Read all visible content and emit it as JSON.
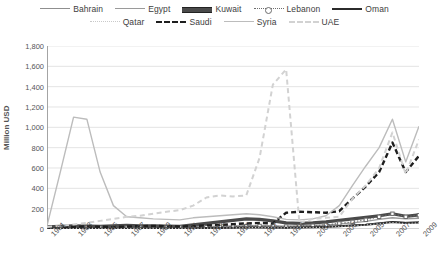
{
  "chart_data": {
    "type": "line",
    "title": "",
    "xlabel": "",
    "ylabel": "Million USD",
    "ylim": [
      0,
      1800
    ],
    "ytick_step": 200,
    "grid": true,
    "legend_position": "top",
    "yticks": [
      "1,800",
      "1,600",
      "1,400",
      "1,200",
      "1,000",
      "800",
      "600",
      "400",
      "200",
      "0"
    ],
    "x": [
      1981,
      1982,
      1983,
      1984,
      1985,
      1986,
      1987,
      1988,
      1989,
      1990,
      1991,
      1992,
      1993,
      1994,
      1995,
      1996,
      1997,
      1998,
      1999,
      2000,
      2001,
      2002,
      2003,
      2004,
      2005,
      2006,
      2007,
      2008,
      2009
    ],
    "xtick_labels": [
      "1981",
      "1983",
      "1985",
      "1987",
      "1989",
      "1991",
      "1993",
      "1995",
      "1997",
      "1999",
      "2001",
      "2003",
      "2005",
      "2007",
      "2009"
    ],
    "series": [
      {
        "name": "Bahrain",
        "style": "solid-medium",
        "color": "#8f8f8f",
        "values": [
          5,
          6,
          8,
          10,
          9,
          11,
          10,
          12,
          14,
          13,
          12,
          15,
          16,
          18,
          20,
          22,
          21,
          19,
          18,
          20,
          22,
          25,
          30,
          38,
          45,
          60,
          72,
          65,
          70
        ]
      },
      {
        "name": "Egypt",
        "style": "solid-medium",
        "color": "#9a9a9a",
        "values": [
          12,
          14,
          16,
          18,
          15,
          17,
          19,
          20,
          22,
          18,
          16,
          20,
          24,
          26,
          30,
          32,
          34,
          30,
          28,
          30,
          34,
          40,
          48,
          60,
          75,
          95,
          110,
          100,
          105
        ]
      },
      {
        "name": "Kuwait",
        "style": "thick-dark",
        "color": "#4a4a4a",
        "values": [
          20,
          25,
          30,
          28,
          26,
          30,
          35,
          32,
          30,
          28,
          25,
          40,
          55,
          70,
          85,
          100,
          95,
          80,
          60,
          55,
          60,
          70,
          85,
          100,
          115,
          130,
          150,
          125,
          140
        ]
      },
      {
        "name": "Lebanon",
        "style": "dotted-marker",
        "color": "#6d6d6d",
        "values": [
          8,
          10,
          12,
          14,
          12,
          10,
          12,
          14,
          16,
          15,
          14,
          16,
          18,
          20,
          24,
          28,
          30,
          26,
          24,
          28,
          32,
          40,
          55,
          70,
          90,
          120,
          150,
          120,
          135
        ]
      },
      {
        "name": "Oman",
        "style": "solid-black",
        "color": "#2b2b2b",
        "values": [
          4,
          5,
          6,
          7,
          6,
          5,
          6,
          7,
          8,
          7,
          6,
          8,
          9,
          10,
          12,
          14,
          15,
          13,
          12,
          14,
          16,
          20,
          26,
          34,
          42,
          55,
          68,
          58,
          64
        ]
      },
      {
        "name": "Qatar",
        "style": "dotted-light",
        "color": "#c9c9c9",
        "values": [
          3,
          4,
          5,
          6,
          5,
          4,
          5,
          6,
          7,
          6,
          5,
          7,
          8,
          9,
          11,
          13,
          14,
          12,
          11,
          13,
          15,
          18,
          24,
          32,
          40,
          52,
          64,
          54,
          60
        ]
      },
      {
        "name": "Saudi",
        "style": "dashed-black",
        "color": "#1e1e1e",
        "values": [
          15,
          18,
          22,
          25,
          22,
          20,
          24,
          28,
          30,
          28,
          25,
          30,
          35,
          40,
          48,
          55,
          60,
          55,
          160,
          170,
          165,
          160,
          175,
          300,
          420,
          560,
          850,
          560,
          720
        ]
      },
      {
        "name": "Syria",
        "style": "solid-light",
        "color": "#bcbcbc",
        "values": [
          30,
          560,
          1100,
          1080,
          560,
          230,
          120,
          110,
          100,
          95,
          90,
          110,
          120,
          130,
          140,
          150,
          140,
          120,
          95,
          90,
          100,
          130,
          230,
          430,
          620,
          800,
          1080,
          660,
          1010
        ]
      },
      {
        "name": "UAE",
        "style": "dashed-light",
        "color": "#d2d2d2",
        "values": [
          20,
          30,
          45,
          60,
          80,
          100,
          120,
          130,
          150,
          170,
          185,
          230,
          310,
          330,
          320,
          330,
          700,
          1420,
          1570,
          60,
          100,
          110,
          120,
          300,
          430,
          600,
          950,
          540,
          880
        ]
      }
    ]
  },
  "legend": {
    "rows": [
      [
        {
          "label": "Bahrain",
          "swatch": "solid-medium"
        },
        {
          "label": "Egypt",
          "swatch": "solid-medium"
        },
        {
          "label": "Kuwait",
          "swatch": "thick-dark"
        },
        {
          "label": "Lebanon",
          "swatch": "dotted-marker"
        },
        {
          "label": "Oman",
          "swatch": "solid-black"
        }
      ],
      [
        {
          "label": "Qatar",
          "swatch": "dotted-light"
        },
        {
          "label": "Saudi",
          "swatch": "dashed-black"
        },
        {
          "label": "Syria",
          "swatch": "solid-light"
        },
        {
          "label": "UAE",
          "swatch": "dashed-light"
        }
      ]
    ]
  }
}
